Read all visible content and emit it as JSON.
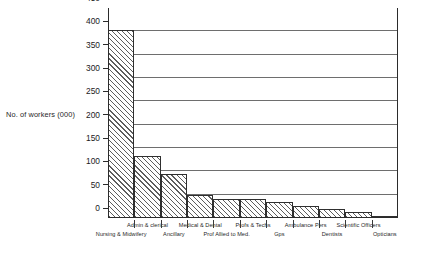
{
  "chart_data": {
    "type": "bar",
    "title": "",
    "xlabel": "",
    "ylabel": "No. of workers (000)",
    "ylim": [
      0,
      450
    ],
    "ytick_values": [
      0,
      50,
      100,
      150,
      200,
      250,
      300,
      350,
      400,
      450
    ],
    "ytick_labels": [
      "0",
      "50",
      "100",
      "150",
      "200",
      "250",
      "300",
      "350",
      "400",
      "450"
    ],
    "grid": "horizontal",
    "legend": "none",
    "categories": [
      "Nursing & Midwifery",
      "Admin & clerical",
      "Ancillary",
      "Medical & Dental",
      "Prof Allied to Med.",
      "Profs & Techs",
      "Gps",
      "Ambulance Pers",
      "Dentists",
      "Scientific Officers",
      "Opticians"
    ],
    "categories_display": [
      {
        "label": "Nursing & Midwifery",
        "row": 1
      },
      {
        "label": "Admin & clerical",
        "row": 0
      },
      {
        "label": "Ancillary",
        "row": 1
      },
      {
        "label": "Medical & Dental",
        "row": 0
      },
      {
        "label": "Prof Allied to Med.",
        "row": 1
      },
      {
        "label": "Profs & Techs",
        "row": 0
      },
      {
        "label": "Gps",
        "row": 1
      },
      {
        "label": "Ambulance Pers",
        "row": 0
      },
      {
        "label": "Dentists",
        "row": 1
      },
      {
        "label": "Scientific Officers",
        "row": 0
      },
      {
        "label": "Opticians",
        "row": 1
      }
    ],
    "values": [
      402,
      132,
      95,
      50,
      40,
      40,
      34,
      25,
      19,
      13,
      4
    ],
    "bar_fill": "diagonal-hatch",
    "bar_edge_color": "#2f2f2f",
    "axis_color": "#2b2b2b",
    "gridline_color": "#6e6e6e"
  }
}
